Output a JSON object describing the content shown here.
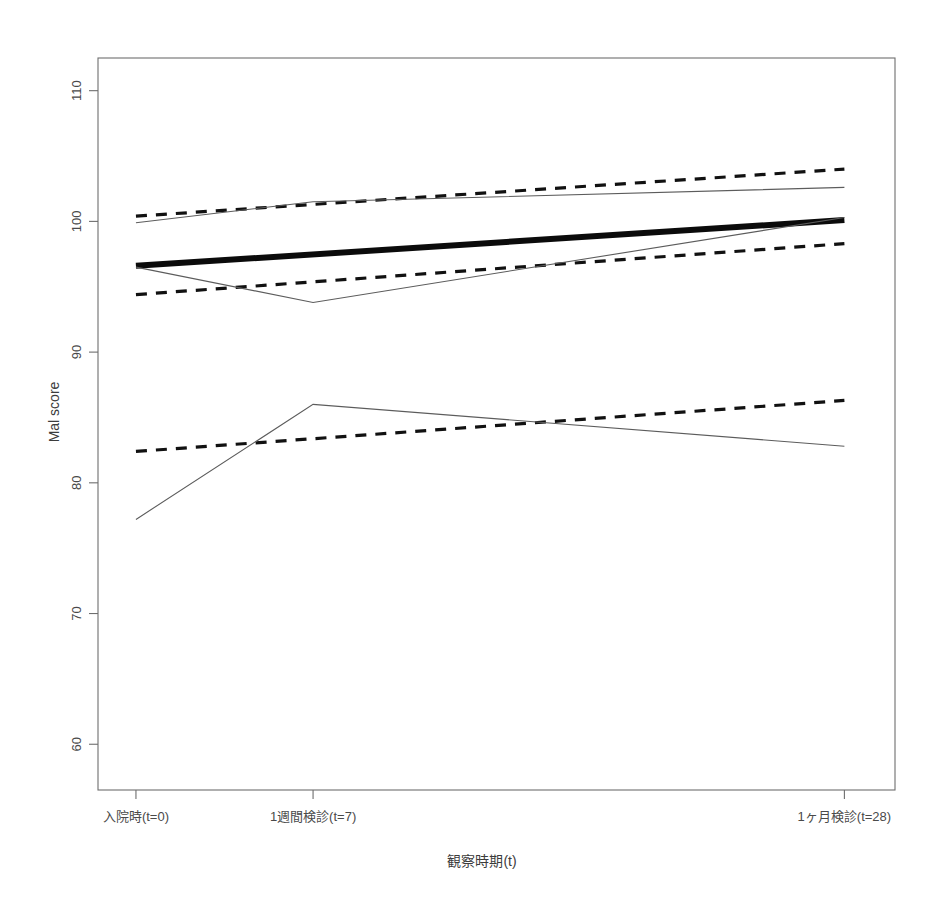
{
  "figure": {
    "background_color": "#ffffff",
    "plot_box": {
      "left": 98,
      "top": 58,
      "right": 895,
      "bottom": 790
    }
  },
  "chart_data": {
    "type": "line",
    "title": "",
    "subtitle": "",
    "xlabel": "観察時期(t)",
    "ylabel": "Mal score",
    "x": [
      0,
      7,
      28
    ],
    "x_tick_labels": [
      "入院時(t=0)",
      "1週間検診(t=7)",
      "1ヶ月検診(t=28)"
    ],
    "x_tick_values": [
      0,
      7,
      28
    ],
    "xlim": [
      -1.5,
      30
    ],
    "y_tick_labels": [
      "60",
      "70",
      "80",
      "90",
      "100",
      "110"
    ],
    "y_tick_values": [
      60,
      70,
      80,
      90,
      100,
      110
    ],
    "ylim": [
      56.5,
      112.5
    ],
    "grid": false,
    "legend": "none",
    "series": [
      {
        "name": "overall-mean-trend",
        "style": "thick-solid",
        "color": "#0b0b0b",
        "linewidth": 6,
        "x": [
          0,
          28
        ],
        "values": [
          96.6,
          100.1
        ]
      },
      {
        "name": "group-high-fitted",
        "style": "dashed",
        "color": "#111111",
        "linewidth": 3.2,
        "x": [
          0,
          28
        ],
        "values": [
          100.4,
          104.0
        ]
      },
      {
        "name": "group-mid-fitted",
        "style": "dashed",
        "color": "#111111",
        "linewidth": 3.2,
        "x": [
          0,
          28
        ],
        "values": [
          94.4,
          98.3
        ]
      },
      {
        "name": "group-low-fitted",
        "style": "dashed",
        "color": "#111111",
        "linewidth": 3.2,
        "x": [
          0,
          28
        ],
        "values": [
          82.4,
          86.3
        ]
      },
      {
        "name": "group-high-observed",
        "style": "thin-solid",
        "color": "#5c5c5c",
        "linewidth": 1.1,
        "x": [
          0,
          7,
          28
        ],
        "values": [
          99.9,
          101.5,
          102.6
        ]
      },
      {
        "name": "group-mid-observed",
        "style": "thin-solid",
        "color": "#5c5c5c",
        "linewidth": 1.1,
        "x": [
          0,
          7,
          28
        ],
        "values": [
          96.5,
          93.8,
          100.3
        ]
      },
      {
        "name": "group-low-observed",
        "style": "thin-solid",
        "color": "#5c5c5c",
        "linewidth": 1.1,
        "x": [
          0,
          7,
          28
        ],
        "values": [
          77.2,
          86.0,
          82.8
        ]
      }
    ]
  }
}
